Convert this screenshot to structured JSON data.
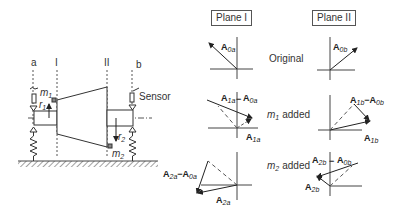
{
  "planes": {
    "plane1": "Plane I",
    "plane2": "Plane II"
  },
  "rows": {
    "original": "Original",
    "m1_added": "added",
    "m2_added": "added",
    "m1": "m",
    "m1_sub": "1",
    "m2": "m",
    "m2_sub": "2"
  },
  "shaft": {
    "label_a": "a",
    "label_b": "b",
    "label_I": "I",
    "label_II": "II",
    "sensor": "Sensor",
    "m": "m",
    "r": "r",
    "sub1": "1",
    "sub2": "2"
  },
  "vectors": {
    "A": "A",
    "A0a": "0a",
    "A0b": "0b",
    "A1a": "1a",
    "A1b": "1b",
    "A2a": "2a",
    "A2b": "2b",
    "minus": "−"
  }
}
